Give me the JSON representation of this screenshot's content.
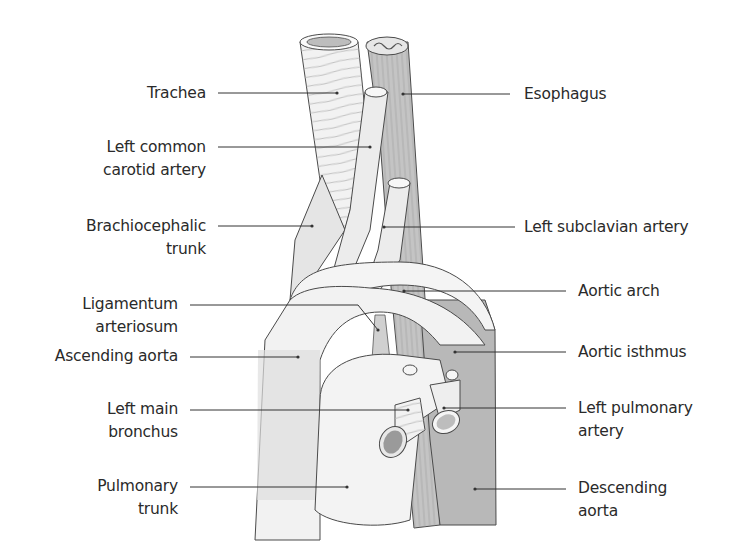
{
  "diagram": {
    "colors": {
      "background": "#ffffff",
      "text": "#2a2a2a",
      "leader_line": "#333333",
      "outline": "#4a4a4a",
      "vessel_light": "#ededed",
      "vessel_mid": "#e0e0e0",
      "aorta_descending": "#b8b8b8",
      "esophagus": "#c4c4c4",
      "trachea": "#f2f2f2"
    },
    "labels_left": [
      {
        "id": "trachea",
        "lines": [
          "Trachea"
        ]
      },
      {
        "id": "left-common-carotid-artery",
        "lines": [
          "Left common",
          "carotid artery"
        ]
      },
      {
        "id": "brachiocephalic-trunk",
        "lines": [
          "Brachiocephalic",
          "trunk"
        ]
      },
      {
        "id": "ligamentum-arteriosum",
        "lines": [
          "Ligamentum",
          "arteriosum"
        ]
      },
      {
        "id": "ascending-aorta",
        "lines": [
          "Ascending aorta"
        ]
      },
      {
        "id": "left-main-bronchus",
        "lines": [
          "Left main",
          "bronchus"
        ]
      },
      {
        "id": "pulmonary-trunk",
        "lines": [
          "Pulmonary",
          "trunk"
        ]
      }
    ],
    "labels_right": [
      {
        "id": "esophagus",
        "lines": [
          "Esophagus"
        ]
      },
      {
        "id": "left-subclavian-artery",
        "lines": [
          "Left subclavian artery"
        ]
      },
      {
        "id": "aortic-arch",
        "lines": [
          "Aortic arch"
        ]
      },
      {
        "id": "aortic-isthmus",
        "lines": [
          "Aortic isthmus"
        ]
      },
      {
        "id": "left-pulmonary-artery",
        "lines": [
          "Left pulmonary",
          "artery"
        ]
      },
      {
        "id": "descending-aorta",
        "lines": [
          "Descending",
          "aorta"
        ]
      }
    ]
  }
}
